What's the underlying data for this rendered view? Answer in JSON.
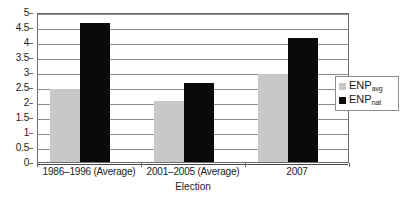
{
  "chart_data": {
    "type": "bar",
    "title": "",
    "subtitle": "",
    "xlabel": "Election",
    "ylabel": "",
    "ylim": [
      0,
      5
    ],
    "ytick_step": 0.5,
    "grid": true,
    "legend_position": "right-inside",
    "categories": [
      "1986–1996 (Average)",
      "2001–2005 (Average)",
      "2007"
    ],
    "series": [
      {
        "name": "ENPavg",
        "name_base": "ENP",
        "name_sub": "avg",
        "color": "#c8c8c8",
        "values": [
          2.42,
          2.03,
          2.95
        ]
      },
      {
        "name": "ENPnat",
        "name_base": "ENP",
        "name_sub": "nat",
        "color": "#0a0a0a",
        "values": [
          4.62,
          2.62,
          4.12
        ]
      }
    ],
    "ytick_labels": [
      "0",
      "0.5",
      "1",
      "1.5",
      "2",
      "2.5",
      "3",
      "3.5",
      "4",
      "4.5",
      "5"
    ],
    "axis_color": "#6b6b6b",
    "gridline_color": "#8c8c8c",
    "plot_background": "#ffffff"
  },
  "axis_title": {
    "x": "Election"
  }
}
